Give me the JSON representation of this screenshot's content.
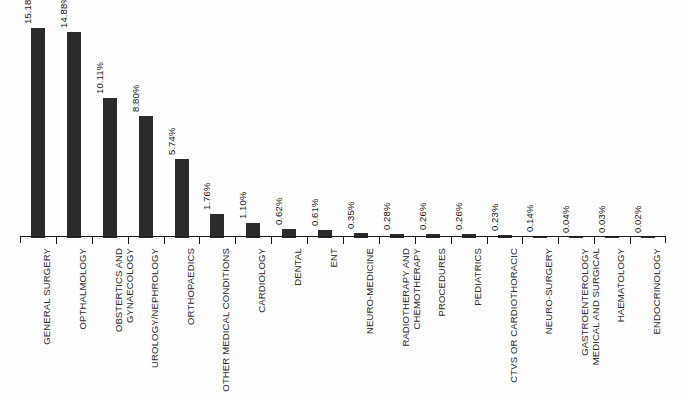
{
  "chart_data": {
    "type": "bar",
    "title": "",
    "subtitle": "",
    "xlabel": "",
    "ylabel": "",
    "grid": false,
    "legend": null,
    "ylim": [
      0,
      16.5
    ],
    "value_suffix": "%",
    "bar_color": "#2b2b2b",
    "axis_color": "#1a1a1a",
    "background_color": "#fdfdfd",
    "categories": [
      "GENERAL SURGERY",
      "OPTHALMOLOGY",
      "OBSTERTICS AND GYNAECOLOGY",
      "UROLOGY/NEPHROLOGY",
      "ORTHOPAEDICS",
      "OTHER MEDICAL CONDITIONS",
      "CARDIOLOGY",
      "DENTAL",
      "ENT",
      "NEURO-MEDICINE",
      "RADIOTHERAPY AND CHEMOTHERAPY",
      "PROCEDURES",
      "PEDIATRICS",
      "CTVS OR CARDIOTHORACIC",
      "NEURO-SURGERY",
      "GASTROENTEROLOGY MEDICAL AND SURGICAL",
      "HAEMATOLOGY",
      "ENDOCRINOLOGY"
    ],
    "category_lines": [
      [
        "GENERAL SURGERY"
      ],
      [
        "OPTHALMOLOGY"
      ],
      [
        "OBSTERTICS AND",
        "GYNAECOLOGY"
      ],
      [
        "UROLOGY/NEPHROLOGY"
      ],
      [
        "ORTHOPAEDICS"
      ],
      [
        "OTHER MEDICAL CONDITIONS"
      ],
      [
        "CARDIOLOGY"
      ],
      [
        "DENTAL"
      ],
      [
        "ENT"
      ],
      [
        "NEURO-MEDICINE"
      ],
      [
        "RADIOTHERAPY AND",
        "CHEMOTHERAPY"
      ],
      [
        "PROCEDURES"
      ],
      [
        "PEDIATRICS"
      ],
      [
        "CTVS OR CARDIOTHORACIC"
      ],
      [
        "NEURO-SURGERY"
      ],
      [
        "GASTROENTEROLOGY",
        "MEDICAL AND SURGICAL"
      ],
      [
        "HAEMATOLOGY"
      ],
      [
        "ENDOCRINOLOGY"
      ]
    ],
    "values": [
      15.18,
      14.88,
      10.11,
      8.8,
      5.74,
      1.76,
      1.1,
      0.62,
      0.61,
      0.35,
      0.28,
      0.26,
      0.26,
      0.23,
      0.14,
      0.04,
      0.03,
      0.02
    ],
    "value_labels": [
      "15.18%",
      "14.88%",
      "10.11%",
      "8.80%",
      "5.74%",
      "1.76%",
      "1.10%",
      "0.62%",
      "0.61%",
      "0.35%",
      "0.28%",
      "0.26%",
      "0.26%",
      "0.23%",
      "0.14%",
      "0.04%",
      "0.03%",
      "0.02%"
    ]
  }
}
